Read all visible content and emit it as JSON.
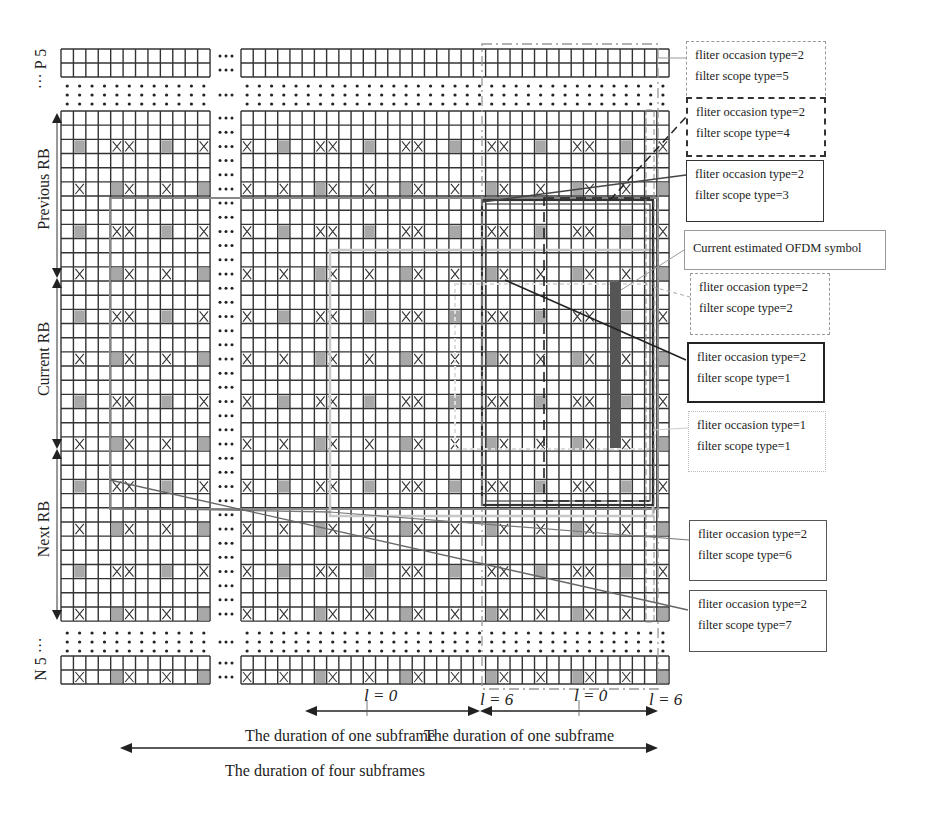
{
  "figure": {
    "type": "resource-grid-filter-diagram",
    "grid": {
      "left_block": {
        "x": 61,
        "cols": 12,
        "cell_w": 12.42
      },
      "right_block": {
        "x": 241,
        "cols": 35,
        "cell_w": 12.23
      },
      "main_rows": {
        "y": 111,
        "rows": 36,
        "cell_h": 14.17
      },
      "top_block": {
        "y": 49,
        "rows": 2,
        "cell_h": 14
      },
      "bottom_block": {
        "y": 656,
        "rows": 2,
        "cell_h": 14
      },
      "shaded_color": "#a8a8a8",
      "estimated_symbol_color": "#555555"
    },
    "row_labels": {
      "top": "··· P 5",
      "previous": "Previous RB",
      "current": "Current RB",
      "next": "Next RB",
      "bottom": "N 5 ···"
    },
    "ellipsis": "···",
    "callouts": [
      {
        "id": "occ2-scope5",
        "line1": "fliter occasion type=2",
        "line2": "filter scope type=5",
        "style": "dash-dot",
        "color": "#888888"
      },
      {
        "id": "occ2-scope4",
        "line1": "fliter occasion type=2",
        "line2": "filter scope type=4",
        "style": "dashed",
        "color": "#333333"
      },
      {
        "id": "occ2-scope3",
        "line1": "fliter occasion type=2",
        "line2": "filter scope type=3",
        "style": "solid",
        "color": "#333333"
      },
      {
        "id": "current-symbol",
        "line1": "Current estimated OFDM symbol",
        "line2": "",
        "style": "solid",
        "color": "#999999"
      },
      {
        "id": "occ2-scope2",
        "line1": "fliter occasion type=2",
        "line2": "filter scope type=2",
        "style": "dashed",
        "color": "#999999"
      },
      {
        "id": "occ2-scope1",
        "line1": "fliter occasion type=2",
        "line2": "filter scope type=1",
        "style": "solid",
        "color": "#222222"
      },
      {
        "id": "occ1-scope1",
        "line1": "fliter occasion type=1",
        "line2": "filter scope type=1",
        "style": "dotted",
        "color": "#bbbbbb"
      },
      {
        "id": "occ2-scope6",
        "line1": "fliter occasion type=2",
        "line2": "filter scope type=6",
        "style": "solid",
        "color": "#555555"
      },
      {
        "id": "occ2-scope7",
        "line1": "fliter occasion type=2",
        "line2": "filter scope type=7",
        "style": "solid",
        "color": "#555555"
      }
    ],
    "symbol_index_labels": [
      "l = 0",
      "l = 6",
      "l = 0",
      "l = 6"
    ],
    "durations": {
      "one_subframe_a": "The duration of one subframe",
      "one_subframe_b": "The duration of one subframe",
      "four_subframes": "The duration of four subframes"
    }
  }
}
